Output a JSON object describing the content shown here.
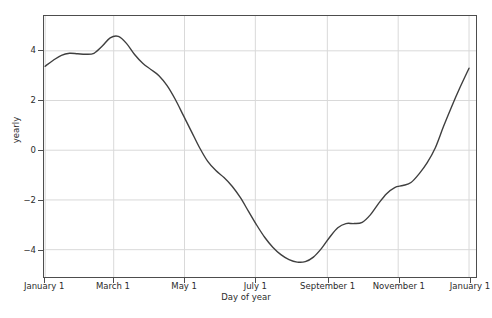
{
  "figure": {
    "background": "#ffffff",
    "line_color": "#3f3f3f",
    "grid_color": "#d9d9d9",
    "axis_color": "#4d4d4d",
    "caption": ""
  },
  "chart_data": {
    "type": "line",
    "title": "",
    "xlabel": "Day of year",
    "ylabel": "yearly",
    "grid": true,
    "legend": "none",
    "ylim": [
      -5.1,
      5.4
    ],
    "yticks": [
      4,
      2,
      0,
      -2,
      -4
    ],
    "ytick_labels": [
      "4",
      "2",
      "0",
      "−2",
      "−4"
    ],
    "xlim": [
      0,
      372
    ],
    "xticks": [
      1,
      60,
      121,
      182,
      244,
      305,
      366
    ],
    "xtick_labels": [
      "January 1",
      "March 1",
      "May 1",
      "July 1",
      "September 1",
      "November 1",
      "January 1"
    ],
    "series": [
      {
        "name": "yearly",
        "color": "#3f3f3f",
        "x": [
          1,
          8,
          15,
          22,
          29,
          36,
          43,
          50,
          57,
          64,
          71,
          78,
          85,
          92,
          99,
          106,
          113,
          120,
          127,
          134,
          141,
          148,
          155,
          162,
          169,
          176,
          183,
          190,
          197,
          204,
          211,
          218,
          225,
          232,
          239,
          246,
          253,
          260,
          267,
          274,
          281,
          288,
          295,
          302,
          309,
          316,
          323,
          330,
          337,
          344,
          351,
          358,
          366
        ],
        "y": [
          3.38,
          3.62,
          3.82,
          3.9,
          3.88,
          3.86,
          3.9,
          4.18,
          4.52,
          4.58,
          4.3,
          3.85,
          3.5,
          3.25,
          3.0,
          2.6,
          2.05,
          1.4,
          0.75,
          0.1,
          -0.45,
          -0.82,
          -1.1,
          -1.45,
          -1.9,
          -2.45,
          -3.0,
          -3.5,
          -3.9,
          -4.2,
          -4.4,
          -4.5,
          -4.48,
          -4.3,
          -3.95,
          -3.5,
          -3.12,
          -2.95,
          -2.95,
          -2.9,
          -2.6,
          -2.15,
          -1.75,
          -1.5,
          -1.42,
          -1.3,
          -0.95,
          -0.5,
          0.1,
          0.95,
          1.75,
          2.5,
          3.3
        ]
      }
    ]
  }
}
